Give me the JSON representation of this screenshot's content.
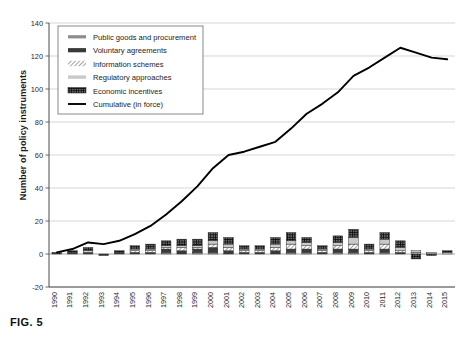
{
  "figure": {
    "caption": "FIG. 5"
  },
  "chart_data": {
    "type": "bar",
    "title": "",
    "subtitle": "",
    "xlabel": "",
    "ylabel": "Number of policy instruments",
    "ylim": [
      -20,
      140
    ],
    "yticks": [
      -20,
      0,
      20,
      40,
      60,
      80,
      100,
      120,
      140
    ],
    "grid": true,
    "stacked": true,
    "legend_position": "top-left",
    "categories": [
      "1990",
      "1991",
      "1992",
      "1993",
      "1994",
      "1995",
      "1996",
      "1997",
      "1998",
      "1999",
      "2000",
      "2001",
      "2002",
      "2003",
      "2004",
      "2005",
      "2006",
      "2007",
      "2008",
      "2009",
      "2010",
      "2011",
      "2012",
      "2013",
      "2014",
      "2015"
    ],
    "series": [
      {
        "name": "Public goods and procurement",
        "style": "gray-medium",
        "color": "#8d8d8d",
        "values": [
          0,
          0,
          0,
          0,
          0,
          0,
          0,
          1,
          0,
          1,
          1,
          0,
          0,
          0,
          0,
          1,
          1,
          0,
          1,
          1,
          0,
          1,
          0,
          0,
          0,
          0
        ]
      },
      {
        "name": "Voluntary agreements",
        "style": "dark-solid",
        "color": "#3a3a3a",
        "values": [
          0,
          1,
          1,
          0,
          1,
          1,
          1,
          2,
          2,
          2,
          3,
          2,
          1,
          1,
          2,
          2,
          2,
          1,
          2,
          2,
          1,
          2,
          1,
          0,
          0,
          0
        ]
      },
      {
        "name": "Information schemes",
        "style": "hatched",
        "color": "#ffffff",
        "values": [
          0,
          0,
          0,
          0,
          0,
          1,
          1,
          1,
          2,
          1,
          2,
          2,
          1,
          1,
          2,
          3,
          2,
          1,
          2,
          3,
          1,
          3,
          1,
          1,
          0,
          0
        ]
      },
      {
        "name": "Regulatory approaches",
        "style": "light-gray",
        "color": "#c9c9c9",
        "values": [
          0,
          0,
          1,
          0,
          0,
          1,
          1,
          1,
          1,
          1,
          2,
          2,
          1,
          1,
          2,
          2,
          2,
          1,
          2,
          4,
          1,
          3,
          2,
          1,
          1,
          1
        ]
      },
      {
        "name": "Economic incentives",
        "style": "black-pattern",
        "color": "#111111",
        "values": [
          1,
          1,
          2,
          -1,
          1,
          2,
          3,
          3,
          4,
          4,
          5,
          4,
          2,
          2,
          4,
          5,
          3,
          2,
          4,
          5,
          3,
          4,
          4,
          -3,
          -1,
          1
        ]
      },
      {
        "name": "Cumulative (in force)",
        "style": "line",
        "color": "#000000",
        "values": [
          1,
          3,
          7,
          6,
          8,
          12,
          17,
          24,
          32,
          41,
          52,
          60,
          62,
          65,
          68,
          76,
          85,
          91,
          98,
          108,
          113,
          119,
          125,
          122,
          119,
          118
        ]
      }
    ],
    "legend_entries": [
      {
        "label": "Public goods and procurement",
        "swatch": "gray-medium"
      },
      {
        "label": "Voluntary agreements",
        "swatch": "dark-solid"
      },
      {
        "label": "Information schemes",
        "swatch": "hatched"
      },
      {
        "label": "Regulatory approaches",
        "swatch": "light-gray"
      },
      {
        "label": "Economic incentives",
        "swatch": "black-pattern"
      },
      {
        "label": "Cumulative (in force)",
        "swatch": "line"
      }
    ]
  }
}
